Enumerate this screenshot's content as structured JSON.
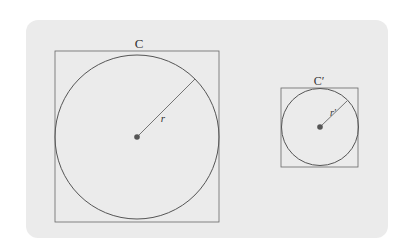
{
  "diagram": {
    "large": {
      "label": "C",
      "radius_label": "r"
    },
    "small": {
      "label": "C′",
      "radius_label": "r′"
    }
  },
  "colors": {
    "panel": "#ebebeb",
    "stroke": "#555555",
    "center": "#555555"
  }
}
